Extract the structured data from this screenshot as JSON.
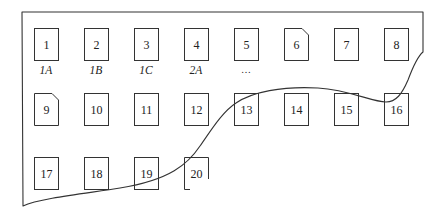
{
  "diagram": {
    "type": "sheet-of-numbered-cells",
    "colors": {
      "stroke": "#333333",
      "background": "#ffffff",
      "text": "#222222"
    },
    "rows": [
      {
        "cells": [
          {
            "num": "1",
            "label": "1A",
            "corner_cut": false
          },
          {
            "num": "2",
            "label": "1B",
            "corner_cut": false
          },
          {
            "num": "3",
            "label": "1C",
            "corner_cut": false
          },
          {
            "num": "4",
            "label": "2A",
            "corner_cut": false
          },
          {
            "num": "5",
            "label": "…",
            "corner_cut": false
          },
          {
            "num": "6",
            "label": "",
            "corner_cut": true
          },
          {
            "num": "7",
            "label": "",
            "corner_cut": false
          },
          {
            "num": "8",
            "label": "",
            "corner_cut": false
          }
        ]
      },
      {
        "cells": [
          {
            "num": "9",
            "label": "",
            "corner_cut": true
          },
          {
            "num": "10",
            "label": "",
            "corner_cut": false
          },
          {
            "num": "11",
            "label": "",
            "corner_cut": false
          },
          {
            "num": "12",
            "label": "",
            "corner_cut": false
          },
          {
            "num": "13",
            "label": "",
            "corner_cut": false
          },
          {
            "num": "14",
            "label": "",
            "corner_cut": false
          },
          {
            "num": "15",
            "label": "",
            "corner_cut": false
          },
          {
            "num": "16",
            "label": "",
            "corner_cut": false
          }
        ]
      },
      {
        "cells": [
          {
            "num": "17",
            "label": "",
            "corner_cut": false
          },
          {
            "num": "18",
            "label": "",
            "corner_cut": false
          },
          {
            "num": "19",
            "label": "",
            "corner_cut": false
          },
          {
            "num": "20",
            "label": "",
            "corner_cut": false
          }
        ]
      }
    ]
  }
}
